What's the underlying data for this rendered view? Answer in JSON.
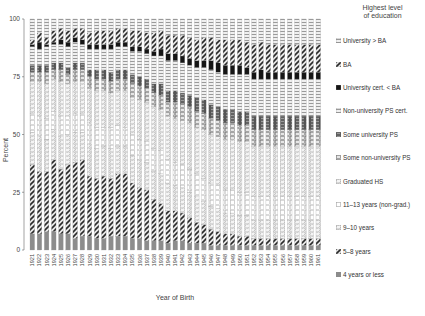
{
  "chart_data": {
    "type": "bar",
    "stacked": true,
    "title": "",
    "xlabel": "Year of Birth",
    "ylabel": "Percent",
    "ylim": [
      0,
      100
    ],
    "yticks": [
      0,
      25,
      50,
      75,
      100
    ],
    "grid": false,
    "legend_title": "Highest level of education",
    "legend_position": "right",
    "categories": [
      "1921",
      "1922",
      "1923",
      "1924",
      "1925",
      "1926",
      "1927",
      "1928",
      "1929",
      "1930",
      "1931",
      "1932",
      "1933",
      "1934",
      "1935",
      "1936",
      "1937",
      "1938",
      "1939",
      "1940",
      "1941",
      "1942",
      "1943",
      "1944",
      "1945",
      "1946",
      "1947",
      "1948",
      "1949",
      "1950",
      "1951",
      "1952",
      "1953",
      "1954",
      "1955",
      "1956",
      "1957",
      "1958",
      "1959",
      "1960",
      "1961"
    ],
    "series": [
      {
        "name": "4 years or less",
        "pattern": "solid-gray",
        "values": [
          7,
          7,
          8,
          8,
          7,
          7,
          5,
          6,
          6,
          5,
          5,
          6,
          6,
          6,
          5,
          5,
          4,
          4,
          4,
          3,
          4,
          4,
          3,
          3,
          3,
          2,
          2,
          2,
          2,
          2,
          2,
          2,
          2,
          2,
          2,
          2,
          2,
          2,
          2,
          2,
          2
        ]
      },
      {
        "name": "5–8 years",
        "pattern": "diagonal",
        "values": [
          30,
          27,
          26,
          31,
          28,
          30,
          33,
          33,
          26,
          26,
          27,
          25,
          27,
          27,
          24,
          22,
          22,
          18,
          16,
          14,
          13,
          12,
          11,
          9,
          8,
          7,
          6,
          5,
          5,
          4,
          4,
          3,
          3,
          3,
          3,
          3,
          3,
          3,
          3,
          3,
          3
        ]
      },
      {
        "name": "9–10 years",
        "pattern": "dotted-boxes",
        "values": [
          14,
          15,
          14,
          13,
          14,
          13,
          13,
          12,
          14,
          13,
          13,
          13,
          12,
          12,
          12,
          12,
          12,
          12,
          13,
          12,
          11,
          11,
          11,
          11,
          10,
          10,
          10,
          9,
          9,
          9,
          9,
          8,
          8,
          8,
          8,
          8,
          8,
          8,
          8,
          8,
          8
        ]
      },
      {
        "name": "11–13 years (non-grad.)",
        "pattern": "open-boxes",
        "values": [
          8,
          9,
          9,
          8,
          9,
          8,
          8,
          8,
          9,
          9,
          8,
          9,
          9,
          8,
          9,
          9,
          9,
          10,
          10,
          10,
          10,
          10,
          10,
          10,
          10,
          10,
          10,
          10,
          10,
          10,
          10,
          10,
          10,
          10,
          10,
          10,
          10,
          10,
          10,
          10,
          10
        ]
      },
      {
        "name": "Graduated HS",
        "pattern": "dotted-boxes",
        "values": [
          14,
          15,
          15,
          14,
          15,
          14,
          14,
          14,
          15,
          16,
          16,
          15,
          15,
          16,
          16,
          17,
          17,
          18,
          18,
          19,
          19,
          19,
          20,
          20,
          21,
          21,
          21,
          22,
          22,
          22,
          22,
          22,
          22,
          22,
          22,
          22,
          22,
          22,
          22,
          22,
          22
        ]
      },
      {
        "name": "Some non-university PS",
        "pattern": "boxes-dot",
        "values": [
          4,
          4,
          5,
          4,
          5,
          4,
          5,
          5,
          5,
          5,
          5,
          5,
          5,
          5,
          6,
          6,
          6,
          6,
          6,
          6,
          7,
          7,
          7,
          7,
          7,
          7,
          7,
          7,
          7,
          7,
          7,
          7,
          7,
          7,
          7,
          7,
          7,
          7,
          7,
          7,
          7
        ]
      },
      {
        "name": "Some university PS",
        "pattern": "dark-boxes",
        "values": [
          3,
          3,
          3,
          3,
          3,
          3,
          3,
          3,
          3,
          4,
          4,
          4,
          4,
          4,
          4,
          4,
          4,
          4,
          5,
          5,
          5,
          5,
          5,
          6,
          6,
          6,
          6,
          6,
          6,
          6,
          6,
          6,
          6,
          6,
          6,
          6,
          6,
          6,
          6,
          6,
          6
        ]
      },
      {
        "name": "Non-university PS cert.",
        "pattern": "horizontal-lines",
        "values": [
          8,
          7,
          8,
          8,
          8,
          9,
          9,
          8,
          9,
          9,
          9,
          10,
          10,
          10,
          10,
          11,
          11,
          12,
          12,
          13,
          13,
          13,
          13,
          13,
          14,
          15,
          15,
          15,
          15,
          16,
          16,
          16,
          16,
          16,
          16,
          16,
          16,
          16,
          16,
          16,
          16
        ]
      },
      {
        "name": "University cert. < BA",
        "pattern": "solid-black",
        "values": [
          1,
          3,
          1,
          1,
          2,
          2,
          2,
          2,
          2,
          2,
          2,
          2,
          2,
          2,
          2,
          2,
          2,
          2,
          3,
          3,
          3,
          3,
          3,
          3,
          3,
          4,
          4,
          4,
          4,
          4,
          3,
          3,
          4,
          3,
          3,
          3,
          3,
          3,
          3,
          3,
          3
        ]
      },
      {
        "name": "BA",
        "pattern": "diagonal",
        "values": [
          2,
          4,
          3,
          5,
          5,
          5,
          4,
          5,
          5,
          6,
          6,
          6,
          6,
          6,
          7,
          7,
          7,
          8,
          8,
          8,
          8,
          9,
          9,
          9,
          10,
          10,
          10,
          11,
          11,
          11,
          11,
          12,
          12,
          12,
          12,
          12,
          12,
          12,
          12,
          12,
          12
        ]
      },
      {
        "name": "University > BA",
        "pattern": "horizontal-lines",
        "values": [
          9,
          6,
          8,
          5,
          4,
          5,
          4,
          4,
          6,
          5,
          5,
          5,
          4,
          4,
          5,
          5,
          6,
          6,
          5,
          7,
          7,
          7,
          8,
          9,
          8,
          8,
          9,
          9,
          9,
          9,
          10,
          11,
          10,
          11,
          11,
          11,
          11,
          11,
          11,
          11,
          11
        ]
      }
    ]
  },
  "legend": {
    "title_line1": "Highest level",
    "title_line2": "of education",
    "items": [
      "University > BA",
      "BA",
      "University cert. < BA",
      "Non-university PS cert.",
      "Some university PS",
      "Some non-university PS",
      "Graduated HS",
      "11–13 years (non-grad.)",
      "9–10 years",
      "5–8 years",
      "4 years or less"
    ]
  },
  "colors": {
    "background": "#ffffff",
    "axis": "#555555",
    "bar_gray": "#8a8a8a",
    "bar_dark": "#1a1a1a",
    "bar_light": "#d8d8d8"
  }
}
